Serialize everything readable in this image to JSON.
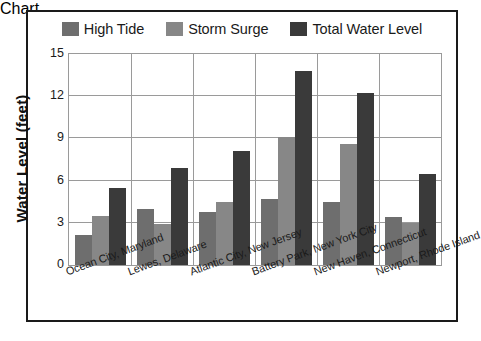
{
  "chart_data": {
    "type": "bar",
    "title": "",
    "xlabel": "",
    "ylabel": "Water Level (feet)",
    "ylim": [
      0,
      15
    ],
    "yticks": [
      0,
      3,
      6,
      9,
      12,
      15
    ],
    "grid": true,
    "legend_position": "top",
    "categories": [
      "Ocean City, Maryland",
      "Lewes, Delaware",
      "Atlantic City, New Jersey",
      "Battery Park, New York City",
      "New Haven, Connecticut",
      "Newport, Rhode Island"
    ],
    "series": [
      {
        "name": "High Tide",
        "color": "#6e6e6e",
        "values": [
          2.1,
          4.0,
          3.8,
          4.7,
          4.5,
          3.4
        ]
      },
      {
        "name": "Storm Surge",
        "color": "#878787",
        "values": [
          3.5,
          2.9,
          4.5,
          9.1,
          8.6,
          3.0
        ]
      },
      {
        "name": "Total Water Level",
        "color": "#3a3a3a",
        "values": [
          5.5,
          6.9,
          8.1,
          13.8,
          12.2,
          6.5
        ]
      }
    ]
  }
}
